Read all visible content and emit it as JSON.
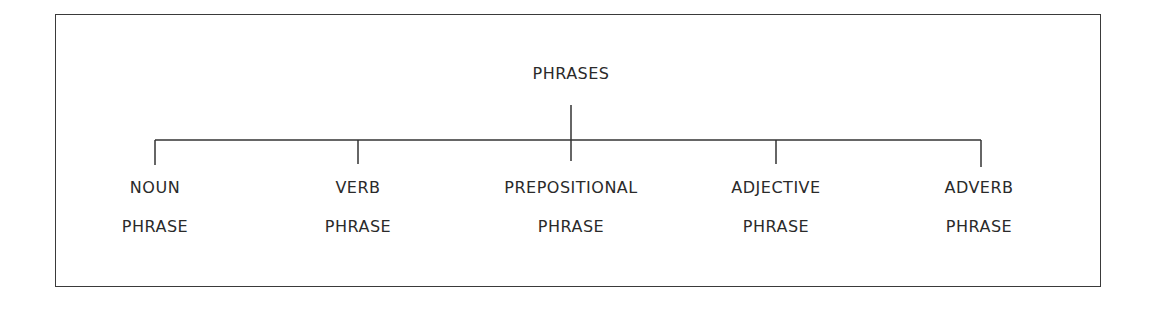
{
  "diagram": {
    "type": "tree",
    "root": {
      "label": "PHRASES"
    },
    "children": [
      {
        "line1": "NOUN",
        "line2": "PHRASE"
      },
      {
        "line1": "VERB",
        "line2": "PHRASE"
      },
      {
        "line1": "PREPOSITIONAL",
        "line2": "PHRASE"
      },
      {
        "line1": "ADJECTIVE",
        "line2": "PHRASE"
      },
      {
        "line1": "ADVERB",
        "line2": "PHRASE"
      }
    ]
  }
}
